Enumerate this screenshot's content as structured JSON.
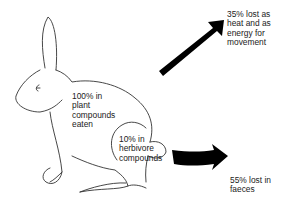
{
  "diagram": {
    "labels": {
      "eaten": "100% in\nplant\ncompounds\neaten",
      "herbivore": "10% in\nherbivore\ncompounds",
      "heat": "35% lost as\nheat and as\nenergy for\nmovement",
      "faeces": "55% lost in\nfaeces"
    },
    "flows": [
      {
        "name": "heat-and-movement",
        "percent": 35
      },
      {
        "name": "faeces",
        "percent": 55
      },
      {
        "name": "herbivore-compounds",
        "percent": 10
      }
    ],
    "colors": {
      "outline": "#333333",
      "arrow": "#000000",
      "text": "#222222"
    }
  }
}
